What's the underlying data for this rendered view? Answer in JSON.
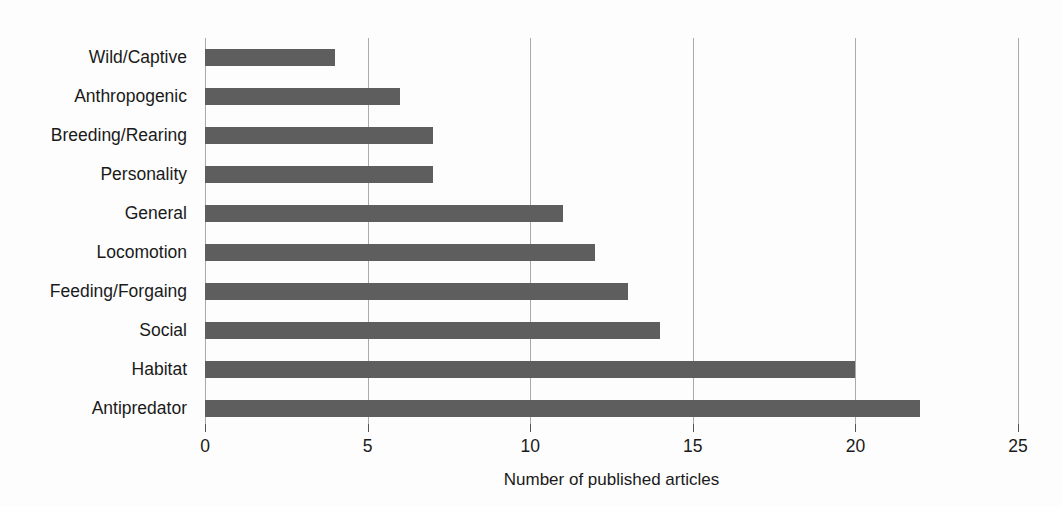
{
  "chart_data": {
    "type": "bar",
    "orientation": "horizontal",
    "title": "",
    "subtitle": "",
    "xlabel": "Number of published articles",
    "ylabel": "",
    "categories": [
      "Wild/Captive",
      "Anthropogenic",
      "Breeding/Rearing",
      "Personality",
      "General",
      "Locomotion",
      "Feeding/Forgaing",
      "Social",
      "Habitat",
      "Antipredator"
    ],
    "values": [
      4,
      6,
      7,
      7,
      11,
      12,
      13,
      14,
      20,
      22
    ],
    "xlim": [
      0,
      25
    ],
    "xticks": [
      0,
      5,
      10,
      15,
      20,
      25
    ],
    "xtick_labels": [
      "0",
      "5",
      "10",
      "15",
      "20",
      "25"
    ],
    "grid": "vertical",
    "legend": "none",
    "bar_color": "#5e5e5e",
    "gridline_color": "#a9a9a9",
    "text_color": "#1a1a1a",
    "background_color": "#fdfdfd"
  }
}
